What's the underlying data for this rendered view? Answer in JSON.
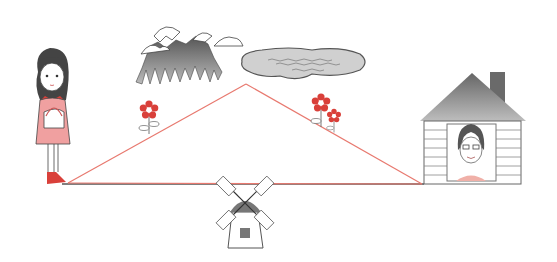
{
  "scene": {
    "title": "",
    "colors": {
      "route_line": "#e8796f",
      "ground_line": "#555555",
      "flower_red": "#d9403a",
      "girl_dress": "#f0a0a0",
      "gray_dark": "#6a6a6a",
      "gray_light": "#cfcfcf"
    },
    "points": {
      "start": {
        "x": 68,
        "y": 183
      },
      "apex": {
        "x": 246,
        "y": 84
      },
      "end": {
        "x": 422,
        "y": 184
      }
    },
    "objects": [
      {
        "name": "girl",
        "x": 50,
        "y": 50
      },
      {
        "name": "mountains",
        "x": 138,
        "y": 25
      },
      {
        "name": "lake",
        "x": 241,
        "y": 45
      },
      {
        "name": "flower-left",
        "x": 148,
        "y": 110
      },
      {
        "name": "flowers-right",
        "x": 325,
        "y": 108
      },
      {
        "name": "house",
        "x": 420,
        "y": 72
      },
      {
        "name": "windmill",
        "x": 245,
        "y": 200
      }
    ]
  }
}
